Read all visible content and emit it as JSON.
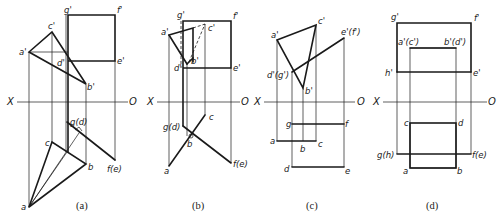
{
  "figure": {
    "panels": [
      {
        "id": "a",
        "caption": "(a)",
        "axis": {
          "left": "X",
          "right": "O"
        },
        "labels": {
          "g_prime": "g'",
          "f_prime": "f'",
          "c_prime": "c'",
          "a_prime": "a'",
          "d_prime": "d'",
          "e_prime": "e'",
          "b_prime": "b'",
          "g_d": "g(d)",
          "c": "c",
          "b": "b",
          "f_e": "f(e)",
          "a": "a"
        }
      },
      {
        "id": "b",
        "caption": "(b)",
        "axis": {
          "left": "X",
          "right": "O"
        },
        "labels": {
          "g_prime": "g'",
          "f_prime": "f'",
          "a_prime": "a'",
          "c_prime": "c'",
          "b_prime": "b'",
          "d_prime": "d'",
          "e_prime": "e'",
          "c": "c",
          "g_d": "g(d)",
          "b": "b",
          "a": "a",
          "f_e": "f(e)"
        }
      },
      {
        "id": "c",
        "caption": "(c)",
        "axis": {
          "left": "X",
          "right": "O"
        },
        "labels": {
          "a_prime": "a'",
          "c_prime": "c'",
          "e_f_prime": "e'(f')",
          "d_g_prime": "d'(g')",
          "b_prime": "b'",
          "g": "g",
          "f": "f",
          "a": "a",
          "b": "b",
          "c": "c",
          "d": "d",
          "e": "e"
        }
      },
      {
        "id": "d",
        "caption": "(d)",
        "axis": {
          "left": "X",
          "right": "O"
        },
        "labels": {
          "g_prime": "g'",
          "f_prime": "f'",
          "a_c_prime": "a'(c')",
          "b_d_prime": "b'(d')",
          "h_prime": "h'",
          "e_prime": "e'",
          "c": "c",
          "d": "d",
          "g_h": "g(h)",
          "f_e": "f(e)",
          "a": "a",
          "b": "b"
        }
      }
    ]
  }
}
